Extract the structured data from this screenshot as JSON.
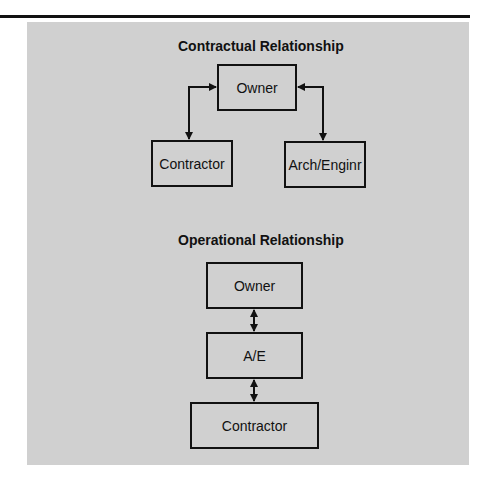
{
  "diagram": {
    "contractual": {
      "title": "Contractual Relationship",
      "nodes": {
        "owner": "Owner",
        "contractor": "Contractor",
        "architect": "Arch/Enginr"
      },
      "edges": [
        {
          "from": "owner",
          "to": "contractor",
          "type": "bidirectional"
        },
        {
          "from": "owner",
          "to": "architect",
          "type": "bidirectional"
        }
      ]
    },
    "operational": {
      "title": "Operational Relationship",
      "nodes": {
        "owner": "Owner",
        "ae": "A/E",
        "contractor": "Contractor"
      },
      "edges": [
        {
          "from": "owner",
          "to": "ae",
          "type": "bidirectional"
        },
        {
          "from": "ae",
          "to": "contractor",
          "type": "bidirectional"
        }
      ]
    }
  },
  "colors": {
    "panel": "#d0d0d0",
    "line": "#111111"
  }
}
